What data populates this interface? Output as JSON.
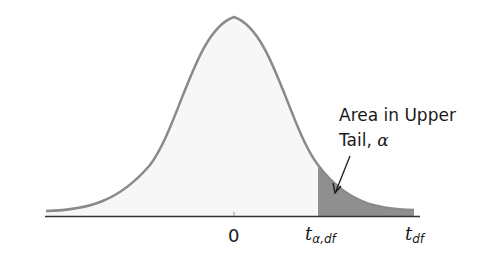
{
  "diagram": {
    "type": "t-distribution upper tail area",
    "annotation": {
      "line1": "Area in Upper",
      "line2_text": "Tail, ",
      "line2_symbol": "α"
    },
    "axis": {
      "tick_zero": "0",
      "tick_critical_main": "t",
      "tick_critical_sub": "α,df",
      "axis_variable_main": "t",
      "axis_variable_sub": "df"
    },
    "colors": {
      "curve": "#8a8a8a",
      "shaded_tail": "#8f8f8f",
      "body_fill": "#f7f7f7",
      "axis": "#333333",
      "text": "#1a1a1a"
    }
  }
}
